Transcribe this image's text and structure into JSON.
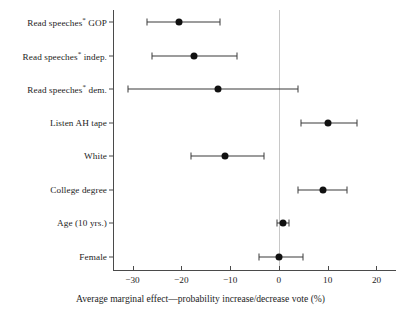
{
  "chart_data": {
    "type": "scatter",
    "title": "",
    "subtitle": "",
    "xlabel": "Average marginal effect—probability increase/decrease vote (%)",
    "ylabel": "",
    "xlim": [
      -34,
      24
    ],
    "xticks": [
      -30,
      -20,
      -10,
      0,
      10,
      20
    ],
    "xtick_labels": [
      "−30",
      "−20",
      "−10",
      "0",
      "10",
      "20"
    ],
    "grid": false,
    "legend": null,
    "reference_line": 0,
    "categories": [
      "Read speeches* GOP",
      "Read speeches* indep.",
      "Read speeches* dem.",
      "Listen AH tape",
      "White",
      "College degree",
      "Age (10 yrs.)",
      "Female"
    ],
    "points": [
      {
        "label": "Read speeches* GOP",
        "label_main": "Read speeches",
        "label_sup": "*",
        "label_tail": " GOP",
        "estimate": -20.5,
        "ci_low": -27.0,
        "ci_high": -12.0
      },
      {
        "label": "Read speeches* indep.",
        "label_main": "Read speeches",
        "label_sup": "*",
        "label_tail": " indep.",
        "estimate": -17.5,
        "ci_low": -26.0,
        "ci_high": -8.5
      },
      {
        "label": "Read speeches* dem.",
        "label_main": "Read speeches",
        "label_sup": "*",
        "label_tail": " dem.",
        "estimate": -12.5,
        "ci_low": -31.0,
        "ci_high": 4.0
      },
      {
        "label": "Listen AH tape",
        "label_main": "Listen AH tape",
        "label_sup": "",
        "label_tail": "",
        "estimate": 10.0,
        "ci_low": 4.5,
        "ci_high": 16.0
      },
      {
        "label": "White",
        "label_main": "White",
        "label_sup": "",
        "label_tail": "",
        "estimate": -11.0,
        "ci_low": -18.0,
        "ci_high": -3.0
      },
      {
        "label": "College degree",
        "label_main": "College degree",
        "label_sup": "",
        "label_tail": "",
        "estimate": 9.0,
        "ci_low": 4.0,
        "ci_high": 14.0
      },
      {
        "label": "Age (10 yrs.)",
        "label_main": "Age (10 yrs.)",
        "label_sup": "",
        "label_tail": "",
        "estimate": 0.8,
        "ci_low": -0.4,
        "ci_high": 2.0
      },
      {
        "label": "Female",
        "label_main": "Female",
        "label_sup": "",
        "label_tail": "",
        "estimate": 0.0,
        "ci_low": -4.0,
        "ci_high": 5.0
      }
    ],
    "colors": {
      "marker": "#111111",
      "ci": "#3a3a3a",
      "axis": "#4a4a4a",
      "reference": "#c8c8c8",
      "background": "#ffffff",
      "text": "#1d1d1d"
    }
  }
}
